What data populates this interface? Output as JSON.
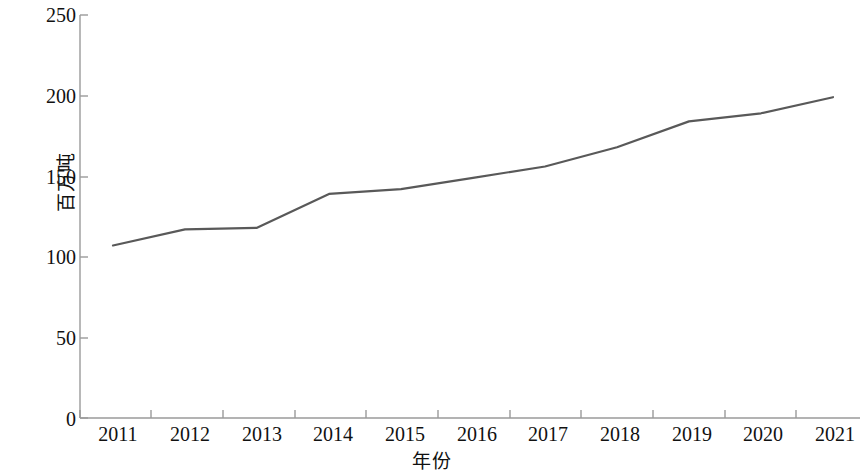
{
  "chart_data": {
    "type": "line",
    "title": "",
    "subtitle": "",
    "xlabel": "年份",
    "ylabel": "百万吨",
    "categories": [
      "2011",
      "2012",
      "2013",
      "2014",
      "2015",
      "2016",
      "2017",
      "2018",
      "2019",
      "2020",
      "2021"
    ],
    "x": [
      2011,
      2012,
      2013,
      2014,
      2015,
      2016,
      2017,
      2018,
      2019,
      2020,
      2021
    ],
    "series": [
      {
        "name": "",
        "values": [
          107,
          117,
          118,
          139,
          142,
          149,
          156,
          168,
          184,
          189,
          199
        ],
        "color": "#595959",
        "line_width": 2.2,
        "markers": "none"
      }
    ],
    "ylim": [
      0,
      250
    ],
    "ytick_values": [
      0,
      50,
      100,
      150,
      200,
      250
    ],
    "ytick_labels": [
      "0",
      "50",
      "100",
      "150",
      "200",
      "250"
    ],
    "xtick_labels": [
      "2011",
      "2012",
      "2013",
      "2014",
      "2015",
      "2016",
      "2017",
      "2018",
      "2019",
      "2020",
      "2021"
    ],
    "grid": false,
    "legend": "none",
    "axis_color": "#8c8c8c",
    "tick_direction": "out",
    "spines": [
      "left",
      "bottom"
    ],
    "annotations": []
  }
}
